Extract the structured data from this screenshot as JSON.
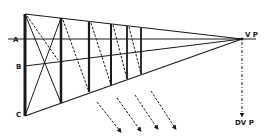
{
  "diagram": {
    "labels": {
      "a": "A",
      "b": "B",
      "c": "C",
      "vp": "V P",
      "dvp": "DV P"
    },
    "colors": {
      "line": "#1a1a1a",
      "background": "#ffffff"
    },
    "vanishing_point": {
      "x": 242,
      "y": 39
    },
    "left_edge": {
      "x": 25,
      "top": 14,
      "bottom": 116
    },
    "horizon_y": 39,
    "line_b_y": 66,
    "verticals_x": [
      25,
      61,
      89,
      111,
      127,
      141
    ],
    "diagonal_arrows": 4
  }
}
